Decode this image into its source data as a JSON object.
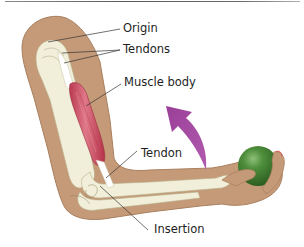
{
  "figure": {
    "labels": {
      "origin": "Origin",
      "tendons": "Tendons",
      "muscle_body": "Muscle body",
      "tendon": "Tendon",
      "insertion": "Insertion"
    },
    "colors": {
      "skin": "#c59a78",
      "skin_outline": "#a9805f",
      "bone": "#f1efd9",
      "muscle": "#c8445a",
      "arrow": "#a24aa0",
      "ball": "#3f7d2f",
      "leader_line": "#333333",
      "text": "#1e1e1e"
    },
    "objects": {
      "arrow": "curved-flexion-arrow",
      "ball": "green-ball"
    }
  }
}
